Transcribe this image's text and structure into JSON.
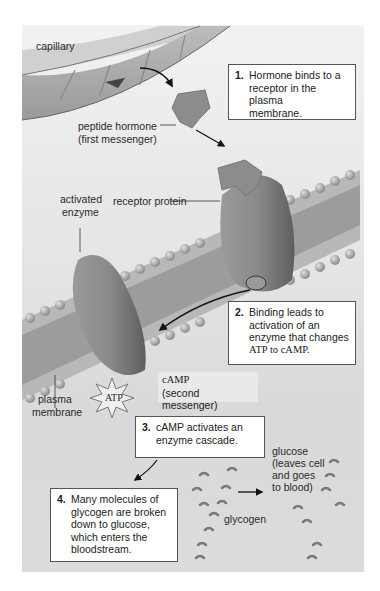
{
  "labels": {
    "capillary": "capillary",
    "peptide_hormone": "peptide hormone",
    "first_messenger": "(first messenger)",
    "activated": "activated",
    "enzyme": "enzyme",
    "receptor_protein": "receptor protein",
    "plasma": "plasma",
    "membrane": "membrane",
    "atp": "ATP",
    "camp": "cAMP",
    "second_messenger": "(second messenger)",
    "glucose": "glucose",
    "leaves_cell": "(leaves cell",
    "and_goes": "and goes",
    "to_blood": "to blood)",
    "glycogen": "glycogen"
  },
  "steps": [
    {
      "num": "1.",
      "lines": [
        "Hormone binds to a",
        "receptor in the plasma",
        "membrane."
      ]
    },
    {
      "num": "2.",
      "lines": [
        "Binding leads to",
        "activation of an",
        "enzyme that changes",
        "ATP to cAMP."
      ]
    },
    {
      "num": "3.",
      "lines": [
        "cAMP activates an",
        "enzyme cascade."
      ]
    },
    {
      "num": "4.",
      "lines": [
        "Many molecules of",
        "glycogen are broken",
        "down to glucose,",
        "which enters the",
        "bloodstream."
      ]
    }
  ],
  "colors": {
    "background": "#ffffff",
    "panel": "#e4e4e4",
    "protein": "#8a8a8a",
    "membrane_head": "#a8a8a8",
    "box_border": "#555555"
  }
}
